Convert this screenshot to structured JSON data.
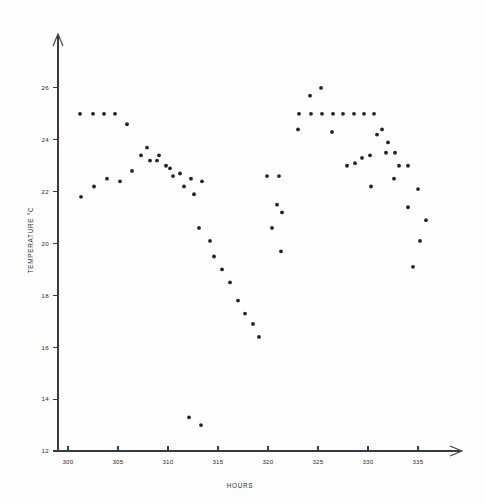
{
  "chart_data": {
    "type": "scatter",
    "title": "",
    "xlabel": "HOURS",
    "ylabel": "TEMPERATURE °C",
    "xlim": [
      299,
      338
    ],
    "ylim": [
      12,
      27
    ],
    "xticks": [
      300,
      305,
      310,
      315,
      320,
      325,
      330,
      335
    ],
    "xtick_labels": [
      "300",
      "305",
      "310",
      "315",
      "320",
      "325",
      "330",
      "335"
    ],
    "yticks": [
      12,
      14,
      16,
      18,
      20,
      22,
      24,
      26
    ],
    "ytick_labels": [
      "12",
      "14",
      "16",
      "18",
      "20",
      "22",
      "24",
      "26"
    ],
    "grid": false,
    "legend": null,
    "marker": "filled-circle",
    "marker_color": "#232323",
    "points": [
      {
        "x": 301.2,
        "y": 25.0
      },
      {
        "x": 302.5,
        "y": 25.0
      },
      {
        "x": 303.6,
        "y": 25.0
      },
      {
        "x": 304.7,
        "y": 25.0
      },
      {
        "x": 305.9,
        "y": 24.6
      },
      {
        "x": 301.3,
        "y": 21.8
      },
      {
        "x": 302.6,
        "y": 22.2
      },
      {
        "x": 303.9,
        "y": 22.5
      },
      {
        "x": 305.2,
        "y": 22.4
      },
      {
        "x": 306.4,
        "y": 22.8
      },
      {
        "x": 307.3,
        "y": 23.4
      },
      {
        "x": 307.9,
        "y": 23.7
      },
      {
        "x": 308.2,
        "y": 23.2
      },
      {
        "x": 308.9,
        "y": 23.2
      },
      {
        "x": 309.1,
        "y": 23.4
      },
      {
        "x": 309.8,
        "y": 23.0
      },
      {
        "x": 310.2,
        "y": 22.9
      },
      {
        "x": 310.5,
        "y": 22.6
      },
      {
        "x": 311.2,
        "y": 22.7
      },
      {
        "x": 311.6,
        "y": 22.2
      },
      {
        "x": 312.3,
        "y": 22.5
      },
      {
        "x": 312.6,
        "y": 21.9
      },
      {
        "x": 313.4,
        "y": 22.4
      },
      {
        "x": 313.1,
        "y": 20.6
      },
      {
        "x": 314.2,
        "y": 20.1
      },
      {
        "x": 314.6,
        "y": 19.5
      },
      {
        "x": 315.4,
        "y": 19.0
      },
      {
        "x": 316.2,
        "y": 18.5
      },
      {
        "x": 317.0,
        "y": 17.8
      },
      {
        "x": 317.7,
        "y": 17.3
      },
      {
        "x": 318.5,
        "y": 16.9
      },
      {
        "x": 319.1,
        "y": 16.4
      },
      {
        "x": 312.1,
        "y": 13.3
      },
      {
        "x": 313.3,
        "y": 13.0
      },
      {
        "x": 319.9,
        "y": 22.6
      },
      {
        "x": 321.1,
        "y": 22.6
      },
      {
        "x": 320.9,
        "y": 21.5
      },
      {
        "x": 321.4,
        "y": 21.2
      },
      {
        "x": 320.4,
        "y": 20.6
      },
      {
        "x": 321.3,
        "y": 19.7
      },
      {
        "x": 323.1,
        "y": 25.0
      },
      {
        "x": 324.3,
        "y": 25.0
      },
      {
        "x": 325.4,
        "y": 25.0
      },
      {
        "x": 326.5,
        "y": 25.0
      },
      {
        "x": 327.5,
        "y": 25.0
      },
      {
        "x": 328.6,
        "y": 25.0
      },
      {
        "x": 329.6,
        "y": 25.0
      },
      {
        "x": 330.6,
        "y": 25.0
      },
      {
        "x": 324.2,
        "y": 25.7
      },
      {
        "x": 325.3,
        "y": 26.0
      },
      {
        "x": 323.0,
        "y": 24.4
      },
      {
        "x": 326.4,
        "y": 24.3
      },
      {
        "x": 330.9,
        "y": 24.2
      },
      {
        "x": 331.4,
        "y": 24.4
      },
      {
        "x": 332.0,
        "y": 23.9
      },
      {
        "x": 331.8,
        "y": 23.5
      },
      {
        "x": 332.7,
        "y": 23.5
      },
      {
        "x": 329.4,
        "y": 23.3
      },
      {
        "x": 330.2,
        "y": 23.4
      },
      {
        "x": 327.9,
        "y": 23.0
      },
      {
        "x": 328.7,
        "y": 23.1
      },
      {
        "x": 333.1,
        "y": 23.0
      },
      {
        "x": 334.0,
        "y": 23.0
      },
      {
        "x": 332.6,
        "y": 22.5
      },
      {
        "x": 330.3,
        "y": 22.2
      },
      {
        "x": 335.0,
        "y": 22.1
      },
      {
        "x": 334.0,
        "y": 21.4
      },
      {
        "x": 335.8,
        "y": 20.9
      },
      {
        "x": 335.2,
        "y": 20.1
      },
      {
        "x": 334.5,
        "y": 19.1
      }
    ]
  },
  "axes": {
    "x_axis_name": "hours-axis",
    "y_axis_name": "temperature-axis"
  }
}
